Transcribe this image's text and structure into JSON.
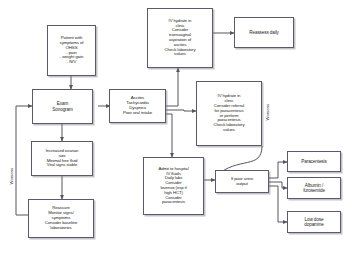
{
  "diagram": {
    "edge_color": "#55555f",
    "node_border_color": "#5a5a6e",
    "node_fill": "#ffffff",
    "nodes": [
      {
        "id": "patient",
        "label": "Patient with\nsymptoms of\nOHSS\n- pain\n- weight gain\n- N/V"
      },
      {
        "id": "exam",
        "label": "Exam\nSonogram"
      },
      {
        "id": "increased",
        "label": "Increased ovarian\nsize\nMinimal free fluid\nVital signs stable"
      },
      {
        "id": "reassure",
        "label": "Reassure\nMonitor signs/\nsymptoms\nConsider baseline\nlaboratories"
      },
      {
        "id": "ascites",
        "label": "Ascites\nTachycardia\nDyspnea\nPoor oral intake"
      },
      {
        "id": "ivclinic1",
        "label": "IV hydrate in\nclinic\nConsider\ntransvaginal\naspiration of\nascites\nCheck laboratory\nvalues"
      },
      {
        "id": "ivclinic2",
        "label": "IV hydrate in\nclinic\nConsider referral\nfor paracentesis\nor perform\nparacentesis\nCheck laboratory\nvalues"
      },
      {
        "id": "reassess",
        "label": "Reassess daily"
      },
      {
        "id": "admit",
        "label": "Admit to hospital\nIV fluids\nDaily labs\nConsider\nlovenox (esp if\nhigh HCT)\nConsider\nparacentesis"
      },
      {
        "id": "poorurine",
        "label": "If poor urine\noutput"
      },
      {
        "id": "paracentesis",
        "label": "Paracentesis"
      },
      {
        "id": "albumin",
        "label": "Albumin /\nfurosemide"
      },
      {
        "id": "dopamine",
        "label": "Low dose\ndopamine"
      }
    ],
    "edge_labels": [
      {
        "id": "worsens-left",
        "label": "Worsens"
      },
      {
        "id": "worsens-right",
        "label": "Worsens"
      }
    ]
  }
}
